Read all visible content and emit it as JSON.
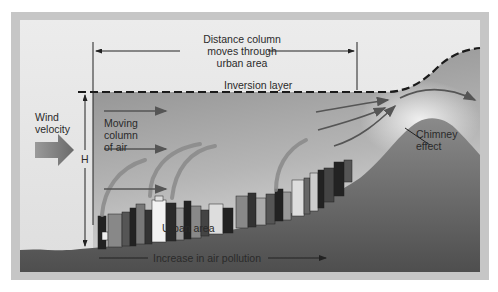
{
  "diagram": {
    "title_block": {
      "distance_label_line1": "Distance column",
      "distance_label_line2": "moves through",
      "distance_label_line3": "urban area"
    },
    "inversion_label": "Inversion layer",
    "wind_label_line1": "Wind",
    "wind_label_line2": "velocity",
    "height_label": "H",
    "moving_column_line1": "Moving",
    "moving_column_line2": "column",
    "moving_column_line3": "of air",
    "chimney_line1": "Chimney",
    "chimney_line2": "effect",
    "urban_area_label": "Urban area",
    "pollution_label": "Increase in air pollution",
    "colors": {
      "frame_outer": "#c8c8c8",
      "frame_inner": "#bdbdbd",
      "sky": "#e6e6e6",
      "air_column": "#8c8c8c",
      "ground_dark": "#555555",
      "text": "#2a2a2a",
      "arrow": "#555555"
    }
  }
}
